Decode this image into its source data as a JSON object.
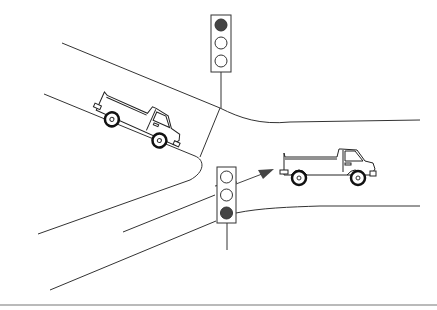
{
  "diagram": {
    "colors": {
      "background": "#ffffff",
      "line": "#333333",
      "light_on": "#444444",
      "light_off": "#ffffff",
      "arrow": "#444444",
      "bottom_rule": "#777777"
    },
    "traffic_lights": [
      {
        "id": "upper",
        "position": "top-center",
        "lights": [
          "on",
          "off",
          "off"
        ],
        "active": "top"
      },
      {
        "id": "lower",
        "position": "center",
        "lights": [
          "off",
          "off",
          "on"
        ],
        "active": "bottom"
      }
    ],
    "vehicles": [
      {
        "id": "truck-left",
        "type": "pickup truck",
        "direction": "down-right along diagonal road"
      },
      {
        "id": "truck-right",
        "type": "pickup truck",
        "direction": "right along horizontal road"
      }
    ],
    "arrow": {
      "direction": "up-right",
      "meaning": "direction of travel"
    }
  }
}
